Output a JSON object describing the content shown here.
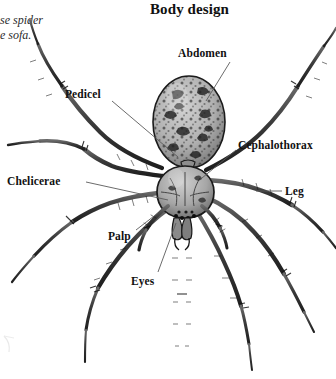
{
  "page": {
    "title": "Body design",
    "background_color": "#ffffff",
    "ink_color": "#111111",
    "width": 336,
    "height": 379
  },
  "caption_fragment": {
    "line1": "se spider",
    "line2": "e sofa.",
    "note": "partially cropped italic caption at left edge"
  },
  "figure": {
    "subject": "spider",
    "style": "black-and-white engraving / halftone illustration",
    "body_fill": "#b9b9b9",
    "body_outline": "#1a1a1a",
    "leg_color": "#3a3a3a",
    "leader_line_color": "#555555"
  },
  "labels": [
    {
      "id": "abdomen",
      "text": "Abdomen",
      "x": 178,
      "y": 47,
      "leader_from": [
        230,
        62
      ],
      "leader_to": [
        206,
        100
      ]
    },
    {
      "id": "cephalothorax",
      "text": "Cephalothorax",
      "x": 238,
      "y": 139,
      "leader_from": [
        236,
        150
      ],
      "leader_to": [
        200,
        176
      ]
    },
    {
      "id": "pedicel",
      "text": "Pedicel",
      "x": 65,
      "y": 88,
      "leader_from": [
        112,
        101
      ],
      "leader_to": [
        168,
        152
      ]
    },
    {
      "id": "chelicerae",
      "text": "Chelicerae",
      "x": 7,
      "y": 175,
      "leader_from": [
        84,
        183
      ],
      "leader_to": [
        163,
        199
      ]
    },
    {
      "id": "leg",
      "text": "Leg",
      "x": 285,
      "y": 185,
      "leader_from": [
        281,
        192
      ],
      "leader_to": [
        254,
        192
      ]
    },
    {
      "id": "palp",
      "text": "Palp",
      "x": 108,
      "y": 230,
      "leader_from": [
        134,
        230
      ],
      "leader_to": [
        160,
        212
      ]
    },
    {
      "id": "eyes",
      "text": "Eyes",
      "x": 131,
      "y": 275,
      "leader_from": [
        156,
        272
      ],
      "leader_to": [
        174,
        222
      ]
    }
  ]
}
